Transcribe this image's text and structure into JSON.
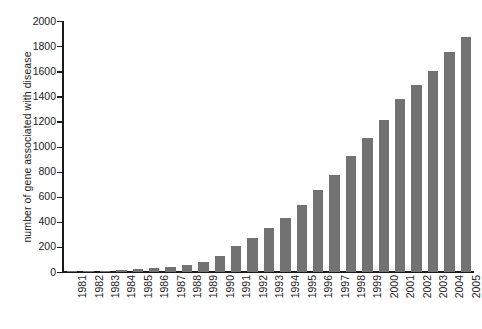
{
  "chart_data": {
    "type": "bar",
    "title": "",
    "xlabel": "",
    "ylabel": "number of gene associated with disease",
    "categories": [
      "1981",
      "1982",
      "1983",
      "1984",
      "1985",
      "1986",
      "1987",
      "1988",
      "1989",
      "1990",
      "1991",
      "1992",
      "1993",
      "1994",
      "1995",
      "1996",
      "1997",
      "1998",
      "1999",
      "2000",
      "2001",
      "2002",
      "2003",
      "2004",
      "2005"
    ],
    "values": [
      5,
      8,
      12,
      16,
      22,
      30,
      40,
      55,
      80,
      130,
      210,
      275,
      350,
      430,
      535,
      650,
      775,
      925,
      1065,
      1215,
      1375,
      1490,
      1600,
      1750,
      1870
    ],
    "ylim": [
      0,
      2000
    ],
    "yticks": [
      0,
      200,
      400,
      600,
      800,
      1000,
      1200,
      1400,
      1600,
      1800,
      2000
    ],
    "ytick_labels": [
      "0",
      "200",
      "400",
      "600",
      "800",
      "1000",
      "1200",
      "1400",
      "1600",
      "1800",
      "2000"
    ],
    "grid": false,
    "legend": null,
    "bar_color": "#727272",
    "axis_color": "#1a1a1a",
    "background_color": "#ffffff"
  }
}
